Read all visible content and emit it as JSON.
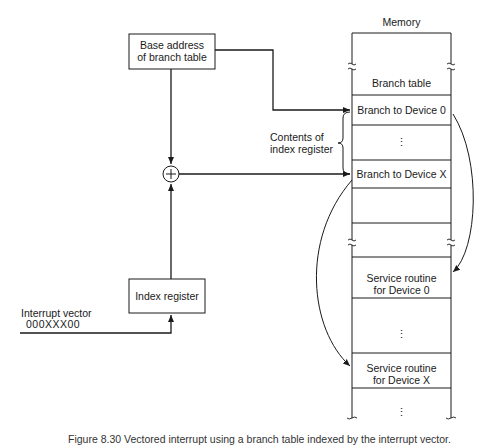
{
  "diagram": {
    "memory_title": "Memory",
    "base_box": {
      "line1": "Base address",
      "line2": "of branch table"
    },
    "index_box": {
      "label": "Index register"
    },
    "interrupt": {
      "label": "Interrupt vector",
      "value": "000XXX00"
    },
    "contents_label": {
      "line1": "Contents of",
      "line2": "index register"
    },
    "adder_symbol": "+",
    "memory_cells": [
      {
        "id": "branch-table",
        "label": "Branch table"
      },
      {
        "id": "branch-device-0",
        "label": "Branch to Device 0"
      },
      {
        "id": "ellipsis-1",
        "label": "⋮"
      },
      {
        "id": "branch-device-x",
        "label": "Branch to Device X"
      },
      {
        "id": "service-0-line1",
        "label": "Service routine"
      },
      {
        "id": "service-0-line2",
        "label": "for Device 0"
      },
      {
        "id": "ellipsis-2",
        "label": "⋮"
      },
      {
        "id": "service-x-line1",
        "label": "Service routine"
      },
      {
        "id": "service-x-line2",
        "label": "for Device X"
      },
      {
        "id": "ellipsis-3",
        "label": "⋮"
      }
    ],
    "caption": "Figure 8.30  Vectored interrupt using a branch table indexed by the interrupt vector."
  }
}
